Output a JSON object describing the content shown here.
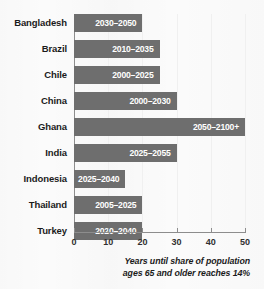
{
  "chart": {
    "type": "bar",
    "orientation": "horizontal",
    "bar_color": "#6e6e6e",
    "background_color": "#fbfbfb",
    "axis_color": "#8d8d8d",
    "value_label_color": "#ffffff",
    "caption_line1": "Years until share of population",
    "caption_line2": "ages 65 and older reaches 14%"
  },
  "chart_data": {
    "type": "bar",
    "title": "",
    "subtitle": "",
    "xlabel": "Years until share of population ages 65 and older reaches 14%",
    "ylabel": "",
    "xlim": [
      0,
      50
    ],
    "grid": true,
    "legend": "none",
    "orientation": "horizontal",
    "categories": [
      "Bangladesh",
      "Brazil",
      "Chile",
      "China",
      "Ghana",
      "India",
      "Indonesia",
      "Thailand",
      "Turkey"
    ],
    "values": [
      20,
      25,
      25,
      30,
      50,
      30,
      15,
      20,
      20
    ],
    "data_labels": [
      "2030–2050",
      "2010–2035",
      "2000–2025",
      "2000–2030",
      "2050–2100+",
      "2025–2055",
      "2025–2040",
      "2005–2025",
      "2020–2040"
    ],
    "xticks": [
      0,
      10,
      20,
      30,
      40,
      50
    ],
    "xtick_labels": [
      "0",
      "10",
      "20",
      "30",
      "40",
      "50"
    ]
  },
  "bars": [
    {
      "label": "Bangladesh",
      "value": 20,
      "value_label": "2030–2050"
    },
    {
      "label": "Brazil",
      "value": 25,
      "value_label": "2010–2035"
    },
    {
      "label": "Chile",
      "value": 25,
      "value_label": "2000–2025"
    },
    {
      "label": "China",
      "value": 30,
      "value_label": "2000–2030"
    },
    {
      "label": "Ghana",
      "value": 50,
      "value_label": "2050–2100+"
    },
    {
      "label": "India",
      "value": 30,
      "value_label": "2025–2055"
    },
    {
      "label": "Indonesia",
      "value": 15,
      "value_label": "2025–2040"
    },
    {
      "label": "Thailand",
      "value": 20,
      "value_label": "2005–2025"
    },
    {
      "label": "Turkey",
      "value": 20,
      "value_label": "2020–2040"
    }
  ],
  "xaxis": {
    "ticks": [
      {
        "value": 0,
        "label": "0"
      },
      {
        "value": 10,
        "label": "10"
      },
      {
        "value": 20,
        "label": "20"
      },
      {
        "value": 30,
        "label": "30"
      },
      {
        "value": 40,
        "label": "40"
      },
      {
        "value": 50,
        "label": "50"
      }
    ]
  }
}
